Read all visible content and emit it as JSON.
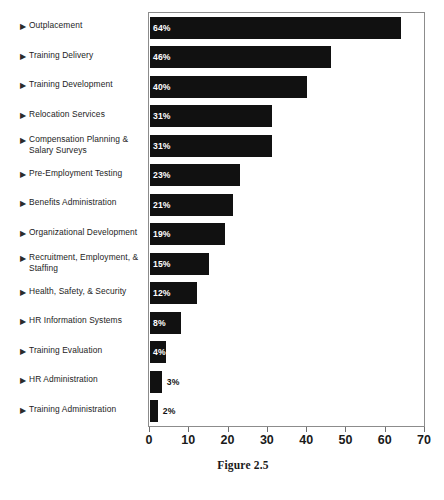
{
  "chart_data": {
    "type": "bar",
    "orientation": "horizontal",
    "title": "",
    "xlabel": "",
    "ylabel": "",
    "xlim": [
      0,
      70
    ],
    "xticks": [
      0,
      10,
      20,
      30,
      40,
      50,
      60,
      70
    ],
    "grid": false,
    "legend": null,
    "bar_color": "#111111",
    "categories": [
      "Outplacement",
      "Training Delivery",
      "Training Development",
      "Relocation Services",
      "Compensation Planning &\nSalary Surveys",
      "Pre-Employment Testing",
      "Benefits Administration",
      "Organizational Development",
      "Recruitment, Employment, &\nStaffing",
      "Health, Safety, & Security",
      "HR Information Systems",
      "Training Evaluation",
      "HR Administration",
      "Training Administration"
    ],
    "values": [
      64,
      46,
      40,
      31,
      31,
      23,
      21,
      19,
      15,
      12,
      8,
      4,
      3,
      2
    ],
    "value_labels": [
      "64%",
      "46%",
      "40%",
      "31%",
      "31%",
      "23%",
      "21%",
      "19%",
      "15%",
      "12%",
      "8%",
      "4%",
      "3%",
      "2%"
    ],
    "label_placement": [
      "inside",
      "inside",
      "inside",
      "inside",
      "inside",
      "inside",
      "inside",
      "inside",
      "inside",
      "inside",
      "inside",
      "inside",
      "outside",
      "outside"
    ]
  },
  "bullet_glyph": "▶",
  "caption": {
    "text": "Figure 2.5"
  }
}
